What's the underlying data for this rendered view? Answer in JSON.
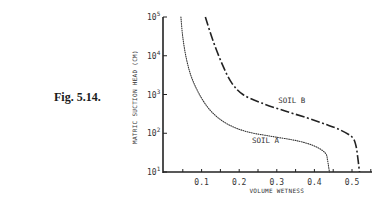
{
  "figure": {
    "label": "Fig. 5.14."
  },
  "chart_data": {
    "type": "line",
    "title": "",
    "xlabel": "VOLUME WETNESS",
    "ylabel": "MATRIC SUCTION HEAD (CM)",
    "xlim": [
      0,
      0.56
    ],
    "ylim": [
      10,
      100000
    ],
    "yscale": "log",
    "grid": false,
    "x_ticks": [
      "0.1",
      "0.2",
      "0.3",
      "0.4",
      "0.5"
    ],
    "y_ticks": [
      {
        "base": "10",
        "exp": "1"
      },
      {
        "base": "10",
        "exp": "2"
      },
      {
        "base": "10",
        "exp": "3"
      },
      {
        "base": "10",
        "exp": "4"
      },
      {
        "base": "10",
        "exp": "5"
      }
    ],
    "series": [
      {
        "name": "SOIL A",
        "style": "dotted",
        "points": [
          [
            0.045,
            100000
          ],
          [
            0.05,
            30000
          ],
          [
            0.06,
            8000
          ],
          [
            0.075,
            2500
          ],
          [
            0.1,
            800
          ],
          [
            0.13,
            330
          ],
          [
            0.17,
            170
          ],
          [
            0.22,
            110
          ],
          [
            0.28,
            85
          ],
          [
            0.34,
            68
          ],
          [
            0.38,
            55
          ],
          [
            0.41,
            42
          ],
          [
            0.43,
            30
          ],
          [
            0.435,
            20
          ],
          [
            0.44,
            10
          ]
        ]
      },
      {
        "name": "SOIL B",
        "style": "dash-dot",
        "points": [
          [
            0.11,
            100000
          ],
          [
            0.13,
            25000
          ],
          [
            0.155,
            6000
          ],
          [
            0.18,
            2000
          ],
          [
            0.21,
            1000
          ],
          [
            0.26,
            600
          ],
          [
            0.32,
            380
          ],
          [
            0.38,
            250
          ],
          [
            0.43,
            170
          ],
          [
            0.47,
            120
          ],
          [
            0.5,
            80
          ],
          [
            0.51,
            50
          ],
          [
            0.515,
            25
          ],
          [
            0.52,
            10
          ]
        ]
      }
    ],
    "annotations": [
      {
        "text": "SOIL A",
        "x": 0.27,
        "y": 55
      },
      {
        "text": "SOIL B",
        "x": 0.34,
        "y": 600
      }
    ]
  }
}
